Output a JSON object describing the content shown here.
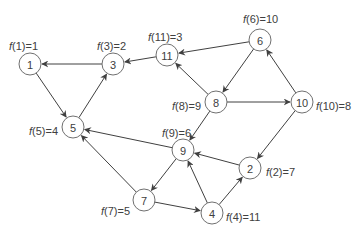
{
  "diagram": {
    "type": "directed-graph",
    "colors": {
      "stroke": "#404040",
      "node_border": "#707070",
      "background": "#ffffff",
      "text": "#404040"
    },
    "node_radius": 11,
    "nodes": [
      {
        "id": "1",
        "x": 30,
        "y": 64,
        "label": "1",
        "f_fn": "f",
        "f_arg": "(1)=1",
        "lx": 9,
        "ly": 46,
        "anchor": "start"
      },
      {
        "id": "3",
        "x": 113,
        "y": 64,
        "label": "3",
        "f_fn": "f",
        "f_arg": "(3)=2",
        "lx": 97,
        "ly": 46,
        "anchor": "start"
      },
      {
        "id": "11",
        "x": 167,
        "y": 55,
        "label": "11",
        "f_fn": "f",
        "f_arg": "(11)=3",
        "lx": 148,
        "ly": 37,
        "anchor": "start"
      },
      {
        "id": "6",
        "x": 260,
        "y": 40,
        "label": "6",
        "f_fn": "f",
        "f_arg": "(6)=10",
        "lx": 243,
        "ly": 19,
        "anchor": "start"
      },
      {
        "id": "8",
        "x": 216,
        "y": 102,
        "label": "8",
        "f_fn": "f",
        "f_arg": "(8)=9",
        "lx": 172,
        "ly": 106,
        "anchor": "start"
      },
      {
        "id": "10",
        "x": 302,
        "y": 102,
        "label": "10",
        "f_fn": "f",
        "f_arg": "(10)=8",
        "lx": 316,
        "ly": 106,
        "anchor": "start"
      },
      {
        "id": "5",
        "x": 73,
        "y": 127,
        "label": "5",
        "f_fn": "f",
        "f_arg": "(5)=4",
        "lx": 29,
        "ly": 131,
        "anchor": "start"
      },
      {
        "id": "9",
        "x": 183,
        "y": 150,
        "label": "9",
        "f_fn": "f",
        "f_arg": "(9)=6",
        "lx": 162,
        "ly": 133,
        "anchor": "start"
      },
      {
        "id": "2",
        "x": 250,
        "y": 168,
        "label": "2",
        "f_fn": "f",
        "f_arg": "(2)=7",
        "lx": 266,
        "ly": 172,
        "anchor": "start"
      },
      {
        "id": "7",
        "x": 144,
        "y": 200,
        "label": "7",
        "f_fn": "f",
        "f_arg": "(7)=5",
        "lx": 101,
        "ly": 211,
        "anchor": "start"
      },
      {
        "id": "4",
        "x": 212,
        "y": 213,
        "label": "4",
        "f_fn": "f",
        "f_arg": "(4)=11",
        "lx": 226,
        "ly": 217,
        "anchor": "start"
      }
    ],
    "edges": [
      {
        "from": "3",
        "to": "1"
      },
      {
        "from": "1",
        "to": "5"
      },
      {
        "from": "5",
        "to": "3"
      },
      {
        "from": "11",
        "to": "3"
      },
      {
        "from": "6",
        "to": "11"
      },
      {
        "from": "6",
        "to": "8"
      },
      {
        "from": "8",
        "to": "11"
      },
      {
        "from": "8",
        "to": "10"
      },
      {
        "from": "10",
        "to": "6"
      },
      {
        "from": "8",
        "to": "9"
      },
      {
        "from": "10",
        "to": "2"
      },
      {
        "from": "9",
        "to": "5"
      },
      {
        "from": "9",
        "to": "7"
      },
      {
        "from": "7",
        "to": "5"
      },
      {
        "from": "7",
        "to": "4"
      },
      {
        "from": "4",
        "to": "9"
      },
      {
        "from": "4",
        "to": "2"
      },
      {
        "from": "2",
        "to": "9"
      }
    ]
  }
}
